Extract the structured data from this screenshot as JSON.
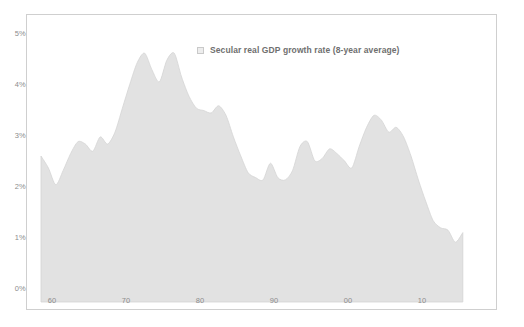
{
  "chart_data": {
    "type": "area",
    "title": "",
    "subtitle": "",
    "xlabel": "",
    "ylabel": "",
    "grid": false,
    "legend_position": "top-center",
    "legend": [
      "Secular real GDP growth rate (8-year average)"
    ],
    "series": [
      {
        "name": "Secular real GDP growth rate (8-year average)",
        "color": "#e2e2e2",
        "line_color": "#d4d4d4",
        "x": [
          1960,
          1961,
          1962,
          1963,
          1964,
          1965,
          1966,
          1967,
          1968,
          1969,
          1970,
          1971,
          1972,
          1973,
          1974,
          1975,
          1976,
          1977,
          1978,
          1979,
          1980,
          1981,
          1982,
          1983,
          1984,
          1985,
          1986,
          1987,
          1988,
          1989,
          1990,
          1991,
          1992,
          1993,
          1994,
          1995,
          1996,
          1997,
          1998,
          1999,
          2000,
          2001,
          2002,
          2003,
          2004,
          2005,
          2006,
          2007,
          2008,
          2009,
          2010,
          2011,
          2012,
          2013,
          2014,
          2015,
          2016,
          2017
        ],
        "values": [
          3.05,
          2.8,
          2.45,
          2.75,
          3.1,
          3.35,
          3.3,
          3.15,
          3.45,
          3.3,
          3.55,
          4.05,
          4.55,
          5.0,
          5.2,
          4.85,
          4.6,
          5.05,
          5.2,
          4.7,
          4.3,
          4.05,
          4.0,
          3.95,
          4.1,
          3.9,
          3.45,
          3.05,
          2.7,
          2.6,
          2.55,
          2.9,
          2.6,
          2.55,
          2.75,
          3.25,
          3.35,
          2.95,
          3.0,
          3.2,
          3.1,
          2.95,
          2.8,
          3.25,
          3.65,
          3.9,
          3.8,
          3.55,
          3.65,
          3.45,
          3.05,
          2.55,
          2.1,
          1.7,
          1.55,
          1.5,
          1.25,
          1.45
        ]
      }
    ],
    "x_axis": {
      "tick_values": [
        1960,
        1970,
        1980,
        1990,
        2000,
        2010
      ],
      "tick_labels": [
        "60",
        "70",
        "80",
        "90",
        "00",
        "10"
      ],
      "min": 1960,
      "max": 2017
    },
    "y_axis": {
      "tick_values": [
        0,
        1,
        2,
        3,
        4,
        5
      ],
      "tick_labels": [
        "0%",
        "1%",
        "2%",
        "3%",
        "4%",
        "5%"
      ],
      "min": 0,
      "max": 5.6
    }
  },
  "colors": {
    "area_fill": "#e2e2e2",
    "area_line": "#d6d6d6",
    "frame_border": "#cfcfcf",
    "tick_text": "#8d8d8d",
    "legend_text": "#6f6f6f",
    "background": "#ffffff"
  }
}
